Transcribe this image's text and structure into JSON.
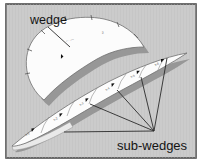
{
  "figure": {
    "labels": {
      "wedge": "wedge",
      "subwedges": "sub-wedges"
    },
    "wedge_marks": [
      {
        "text": "– · ––"
      },
      {
        "text": "2"
      }
    ],
    "segment_marks": [
      {
        "text": "s-1"
      },
      {
        "text": "s-2"
      },
      {
        "text": "s-3"
      },
      {
        "text": "s-4"
      },
      {
        "text": "s-5"
      },
      {
        "text": "s-6"
      }
    ],
    "colors": {
      "canvas": "#cbcbcb",
      "frame": "#4c4c4c",
      "shape_fill": "#fcfcfc",
      "shape_stroke": "#6f6f6f",
      "shadow": "#979797",
      "line": "#2b2b2b",
      "text": "#141414"
    }
  }
}
